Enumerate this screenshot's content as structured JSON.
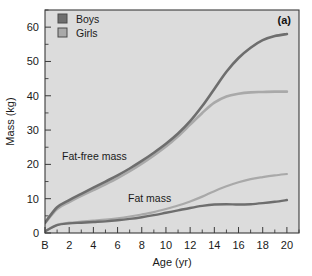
{
  "figure": {
    "panel_label": "(a)",
    "background_color": "#dcdcdc",
    "page_background": "#ffffff",
    "border_color": "#3a3a3a"
  },
  "legend": {
    "position": "top-left",
    "entries": [
      {
        "label": "Boys",
        "color": "#6e6e6e",
        "swatch": "filled-square"
      },
      {
        "label": "Girls",
        "color": "#a9a9a9",
        "swatch": "filled-square"
      }
    ]
  },
  "annotations": [
    {
      "name": "fat-free-mass-label",
      "text": "Fat-free mass",
      "x_px": 62,
      "y_px": 160
    },
    {
      "name": "fat-mass-label",
      "text": "Fat mass",
      "x_px": 128,
      "y_px": 202
    }
  ],
  "axes": {
    "y": {
      "label": "Mass (kg)",
      "ticks": [
        "0",
        "10",
        "20",
        "30",
        "40",
        "50",
        "60"
      ],
      "tick_values": [
        0,
        10,
        20,
        30,
        40,
        50,
        60
      ],
      "minor_step": 5,
      "range": [
        0,
        65
      ]
    },
    "x": {
      "label": "Age (yr)",
      "ticks": [
        "B",
        "2",
        "4",
        "6",
        "8",
        "10",
        "12",
        "14",
        "16",
        "18",
        "20"
      ],
      "tick_values": [
        0,
        2,
        4,
        6,
        8,
        10,
        12,
        14,
        16,
        18,
        20
      ],
      "minor_step": 1,
      "range": [
        0,
        21
      ],
      "birth_tick_label": "B"
    }
  },
  "chart_data": {
    "type": "line",
    "title": "",
    "subtitle": "",
    "panel": "(a)",
    "xlabel": "Age (yr)",
    "ylabel": "Mass (kg)",
    "xlim": [
      0,
      21
    ],
    "ylim": [
      0,
      65
    ],
    "grid": false,
    "legend_position": "top-left",
    "x_tick_labels": [
      "B",
      "2",
      "4",
      "6",
      "8",
      "10",
      "12",
      "14",
      "16",
      "18",
      "20"
    ],
    "x": [
      0,
      1,
      2,
      3,
      4,
      5,
      6,
      7,
      8,
      9,
      10,
      11,
      12,
      13,
      14,
      15,
      16,
      17,
      18,
      19,
      20
    ],
    "series": [
      {
        "name": "Boys fat-free mass",
        "sex": "Boys",
        "component": "Fat-free mass",
        "color": "#6e6e6e",
        "width": 2.6,
        "values": [
          3.0,
          7.5,
          9.6,
          11.4,
          13.2,
          15.0,
          16.8,
          18.8,
          21.0,
          23.4,
          26.0,
          29.0,
          32.6,
          37.0,
          42.0,
          47.0,
          51.0,
          54.0,
          56.2,
          57.4,
          58.0
        ]
      },
      {
        "name": "Girls fat-free mass",
        "sex": "Girls",
        "component": "Fat-free mass",
        "color": "#a9a9a9",
        "width": 2.6,
        "values": [
          2.9,
          7.0,
          9.0,
          10.8,
          12.5,
          14.2,
          16.0,
          18.0,
          20.2,
          22.6,
          25.2,
          28.2,
          31.6,
          35.0,
          38.0,
          39.8,
          40.6,
          41.0,
          41.1,
          41.2,
          41.2
        ]
      },
      {
        "name": "Girls fat mass",
        "sex": "Girls",
        "component": "Fat mass",
        "color": "#a9a9a9",
        "width": 2.2,
        "values": [
          0.5,
          2.4,
          3.0,
          3.3,
          3.6,
          3.9,
          4.3,
          4.8,
          5.4,
          6.1,
          7.0,
          8.0,
          9.2,
          10.6,
          12.2,
          13.6,
          14.8,
          15.7,
          16.3,
          16.8,
          17.2
        ]
      },
      {
        "name": "Boys fat mass",
        "sex": "Boys",
        "component": "Fat mass",
        "color": "#6e6e6e",
        "width": 2.4,
        "values": [
          0.5,
          2.3,
          2.8,
          3.0,
          3.2,
          3.4,
          3.7,
          4.1,
          4.6,
          5.2,
          5.9,
          6.6,
          7.3,
          7.9,
          8.3,
          8.4,
          8.3,
          8.4,
          8.7,
          9.1,
          9.6
        ]
      }
    ]
  }
}
